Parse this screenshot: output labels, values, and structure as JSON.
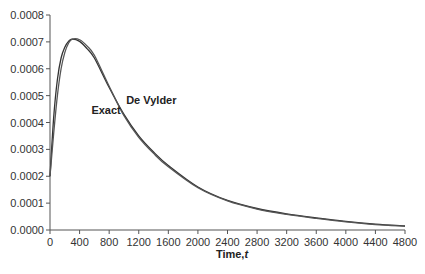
{
  "chart_data": {
    "type": "line",
    "title": "",
    "xlabel": "Time, t",
    "ylabel": "",
    "xlim": [
      0,
      4800
    ],
    "ylim": [
      0,
      0.0008
    ],
    "grid": false,
    "legend": "none (inline annotations)",
    "x_ticks": [
      0,
      400,
      800,
      1200,
      1600,
      2000,
      2400,
      2800,
      3200,
      3600,
      4000,
      4400,
      4800
    ],
    "y_ticks": [
      "0.0000",
      "0.0001",
      "0.0002",
      "0.0003",
      "0.0004",
      "0.0005",
      "0.0006",
      "0.0007",
      "0.0008"
    ],
    "annotations": [
      {
        "text": "Exact",
        "x": 560,
        "y": 0.00043
      },
      {
        "text": "De Vylder",
        "x": 1030,
        "y": 0.00047
      }
    ],
    "x": [
      0,
      50,
      100,
      150,
      200,
      250,
      300,
      400,
      500,
      600,
      800,
      1000,
      1200,
      1400,
      1600,
      2000,
      2400,
      2800,
      3200,
      3600,
      4000,
      4400,
      4800
    ],
    "series": [
      {
        "name": "Exact",
        "values": [
          0.0002,
          0.00042,
          0.00056,
          0.00064,
          0.00068,
          0.000702,
          0.00071,
          0.000702,
          0.000675,
          0.00064,
          0.00053,
          0.00043,
          0.00035,
          0.00029,
          0.00024,
          0.00016,
          0.00011,
          8e-05,
          6e-05,
          4.5e-05,
          3.2e-05,
          2.2e-05,
          1.5e-05
        ]
      },
      {
        "name": "De Vylder",
        "values": [
          0.0002,
          0.00036,
          0.0005,
          0.0006,
          0.00066,
          0.000695,
          0.00071,
          0.000708,
          0.000685,
          0.00065,
          0.000535,
          0.000425,
          0.000345,
          0.000285,
          0.000235,
          0.000157,
          0.000108,
          7.8e-05,
          5.8e-05,
          4.3e-05,
          3e-05,
          2e-05,
          1.4e-05
        ]
      }
    ]
  },
  "axes": {
    "x_title": "Time,",
    "x_title_var": "t"
  }
}
